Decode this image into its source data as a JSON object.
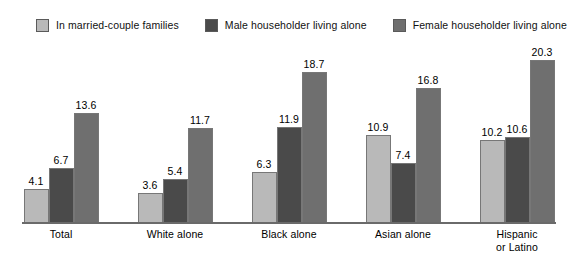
{
  "chart_data": {
    "type": "bar",
    "title": "",
    "subtitle": "",
    "xlabel": "",
    "ylabel": "",
    "ylim": [
      0,
      21
    ],
    "grid": false,
    "legend_position": "top",
    "categories": [
      "Total",
      "White alone",
      "Black alone",
      "Asian alone",
      "Hispanic or Latino"
    ],
    "category_lines": [
      [
        "Total"
      ],
      [
        "White alone"
      ],
      [
        "Black alone"
      ],
      [
        "Asian alone"
      ],
      [
        "Hispanic",
        "or Latino"
      ]
    ],
    "series": [
      {
        "name": "In married-couple families",
        "color": "#b9b9b9",
        "values": [
          4.1,
          3.6,
          6.3,
          10.9,
          10.2
        ],
        "labels": [
          "4.1",
          "3.6",
          "6.3",
          "10.9",
          "10.2"
        ]
      },
      {
        "name": "Male householder living alone",
        "color": "#4a4a4a",
        "values": [
          6.7,
          5.4,
          11.9,
          7.4,
          10.6
        ],
        "labels": [
          "6.7",
          "5.4",
          "11.9",
          "7.4",
          "10.6"
        ]
      },
      {
        "name": "Female householder living alone",
        "color": "#6f6f6f",
        "values": [
          13.6,
          11.7,
          18.7,
          16.8,
          20.3
        ],
        "labels": [
          "13.6",
          "11.7",
          "18.7",
          "16.8",
          "20.3"
        ]
      }
    ]
  },
  "legend": {
    "items": [
      {
        "label": "In married-couple families",
        "color": "#b9b9b9"
      },
      {
        "label": "Male householder living alone",
        "color": "#4a4a4a"
      },
      {
        "label": "Female householder living alone",
        "color": "#6f6f6f"
      }
    ]
  }
}
